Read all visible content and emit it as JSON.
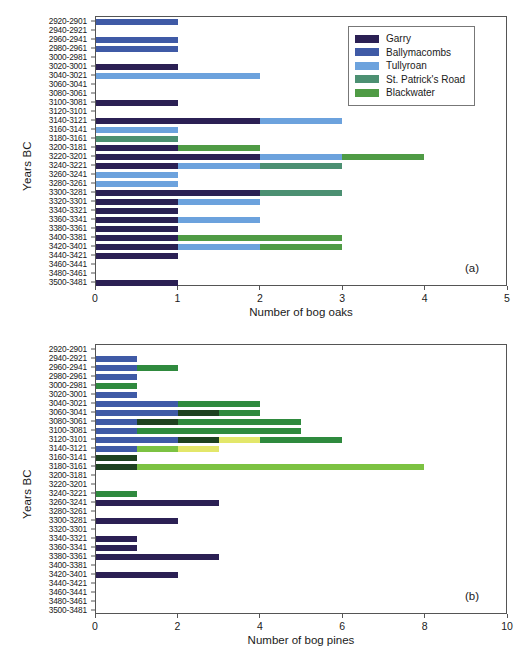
{
  "figure": {
    "panel_a_tag": "(a)",
    "panel_b_tag": "(b)"
  },
  "chart_data": [
    {
      "type": "bar",
      "orientation": "horizontal",
      "stacked": true,
      "panel": "(a)",
      "title": "",
      "xlabel": "Number of bog oaks",
      "ylabel": "Years BC",
      "xlim": [
        0,
        5
      ],
      "xticks": [
        0,
        1,
        2,
        3,
        4,
        5
      ],
      "grid": false,
      "legend_position": "top-right",
      "legend": [
        "Garry",
        "Ballymacombs",
        "Tullyroan",
        "St. Patrick's Road",
        "Blackwater"
      ],
      "colors": {
        "Garry": "#2b2054",
        "Ballymacombs": "#3f5aa6",
        "Tullyroan": "#6ca2dd",
        "St. Patrick's Road": "#4c9072",
        "Blackwater": "#4f9b45"
      },
      "categories": [
        "2920-2901",
        "2940-2921",
        "2960-2941",
        "2980-2961",
        "3000-2981",
        "3020-3001",
        "3040-3021",
        "3060-3041",
        "3080-3061",
        "3100-3081",
        "3120-3101",
        "3140-3121",
        "3160-3141",
        "3180-3161",
        "3200-3181",
        "3220-3201",
        "3240-3221",
        "3260-3241",
        "3280-3261",
        "3300-3281",
        "3320-3301",
        "3340-3321",
        "3360-3341",
        "3380-3361",
        "3400-3381",
        "3420-3401",
        "3440-3421",
        "3460-3441",
        "3480-3461",
        "3500-3481"
      ],
      "series": [
        {
          "name": "Garry",
          "values": [
            0,
            0,
            0,
            0,
            0,
            1,
            0,
            0,
            0,
            1,
            0,
            2,
            0,
            0,
            1,
            2,
            1,
            0,
            0,
            2,
            1,
            1,
            1,
            1,
            1,
            1,
            1,
            0,
            0,
            1
          ]
        },
        {
          "name": "Ballymacombs",
          "values": [
            1,
            0,
            1,
            1,
            0,
            0,
            0,
            0,
            0,
            0,
            0,
            0,
            0,
            0,
            0,
            0,
            0,
            0,
            0,
            0,
            0,
            0,
            0,
            0,
            0,
            0,
            0,
            0,
            0,
            0
          ]
        },
        {
          "name": "Tullyroan",
          "values": [
            0,
            0,
            0,
            0,
            0,
            0,
            2,
            0,
            0,
            0,
            0,
            1,
            1,
            0,
            0,
            1,
            1,
            1,
            1,
            0,
            1,
            0,
            1,
            0,
            0,
            1,
            0,
            0,
            0,
            0
          ]
        },
        {
          "name": "St. Patrick's Road",
          "values": [
            0,
            0,
            0,
            0,
            0,
            0,
            0,
            0,
            0,
            0,
            0,
            0,
            0,
            1,
            0,
            0,
            1,
            0,
            0,
            1,
            0,
            0,
            0,
            0,
            0,
            0,
            0,
            0,
            0,
            0
          ]
        },
        {
          "name": "Blackwater",
          "values": [
            0,
            0,
            0,
            0,
            0,
            0,
            0,
            0,
            0,
            0,
            0,
            0,
            0,
            0,
            1,
            1,
            0,
            0,
            0,
            0,
            0,
            0,
            0,
            0,
            2,
            1,
            0,
            0,
            0,
            0
          ]
        }
      ],
      "totals": [
        1,
        0,
        1,
        1,
        0,
        1,
        2,
        0,
        0,
        1,
        0,
        3,
        1,
        1,
        2,
        4,
        3,
        1,
        1,
        3,
        2,
        1,
        2,
        1,
        3,
        3,
        1,
        0,
        0,
        1
      ]
    },
    {
      "type": "bar",
      "orientation": "horizontal",
      "stacked": true,
      "panel": "(b)",
      "title": "",
      "xlabel": "Number of bog pines",
      "ylabel": "Years BC",
      "xlim": [
        0,
        10
      ],
      "xticks": [
        0,
        2,
        4,
        6,
        8,
        10
      ],
      "grid": false,
      "legend_position": "middle-right",
      "legend": [
        "Garry",
        "Ballymacombs",
        "Sharvogues",
        "Tamlaghtmore",
        "Derrycrow",
        "Altnahinch",
        "Eskragh"
      ],
      "colors": {
        "Garry": "#2b2054",
        "Ballymacombs": "#3f5aa6",
        "Sharvogues": "#1e4220",
        "Tamlaghtmore": "#2f7a37",
        "Derrycrow": "#7cc242",
        "Altnahinch": "#e3e76a",
        "Eskragh": "#2f8a3e"
      },
      "categories": [
        "2920-2901",
        "2940-2921",
        "2960-2941",
        "2980-2961",
        "3000-2981",
        "3020-3001",
        "3040-3021",
        "3060-3041",
        "3080-3061",
        "3100-3081",
        "3120-3101",
        "3140-3121",
        "3160-3141",
        "3180-3161",
        "3200-3181",
        "3220-3201",
        "3240-3221",
        "3260-3241",
        "3280-3261",
        "3300-3281",
        "3320-3301",
        "3340-3321",
        "3360-3341",
        "3380-3361",
        "3400-3381",
        "3420-3401",
        "3440-3421",
        "3460-3441",
        "3480-3461",
        "3500-3481"
      ],
      "series": [
        {
          "name": "Garry",
          "values": [
            0,
            0,
            0,
            0,
            0,
            0,
            0,
            0,
            0,
            0,
            0,
            0,
            0,
            0,
            0,
            0,
            0,
            3,
            0,
            2,
            0,
            1,
            1,
            3,
            0,
            2,
            0,
            0,
            0,
            0
          ]
        },
        {
          "name": "Ballymacombs",
          "values": [
            0,
            1,
            1,
            1,
            0,
            1,
            2,
            2,
            1,
            1,
            2,
            1,
            0,
            0,
            0,
            0,
            0,
            0,
            0,
            0,
            0,
            0,
            0,
            0,
            0,
            0,
            0,
            0,
            0,
            0
          ]
        },
        {
          "name": "Sharvogues",
          "values": [
            0,
            0,
            0,
            0,
            0,
            0,
            0,
            1,
            1,
            0,
            1,
            0,
            1,
            1,
            0,
            0,
            0,
            0,
            0,
            0,
            0,
            0,
            0,
            0,
            0,
            0,
            0,
            0,
            0,
            0
          ]
        },
        {
          "name": "Tamlaghtmore",
          "values": [
            0,
            0,
            0,
            0,
            0,
            0,
            0,
            0,
            0,
            0,
            0,
            0,
            0,
            0,
            0,
            0,
            0,
            0,
            0,
            0,
            0,
            0,
            0,
            0,
            0,
            0,
            0,
            0,
            0,
            0
          ]
        },
        {
          "name": "Derrycrow",
          "values": [
            0,
            0,
            0,
            0,
            0,
            0,
            0,
            0,
            0,
            0,
            0,
            1,
            0,
            7,
            0,
            0,
            0,
            0,
            0,
            0,
            0,
            0,
            0,
            0,
            0,
            0,
            0,
            0,
            0,
            0
          ]
        },
        {
          "name": "Altnahinch",
          "values": [
            0,
            0,
            0,
            0,
            0,
            0,
            0,
            0,
            0,
            0,
            1,
            1,
            0,
            0,
            0,
            0,
            0,
            0,
            0,
            0,
            0,
            0,
            0,
            0,
            0,
            0,
            0,
            0,
            0,
            0
          ]
        },
        {
          "name": "Eskragh",
          "values": [
            0,
            0,
            1,
            0,
            1,
            0,
            2,
            1,
            3,
            4,
            2,
            0,
            0,
            0,
            0,
            0,
            1,
            0,
            0,
            0,
            0,
            0,
            0,
            0,
            0,
            0,
            0,
            0,
            0,
            0
          ]
        }
      ],
      "totals": [
        0,
        1,
        2,
        1,
        1,
        1,
        4,
        5,
        5,
        6,
        5,
        3,
        1,
        8,
        0,
        0,
        1,
        3,
        0,
        2,
        0,
        1,
        1,
        3,
        0,
        2,
        0,
        0,
        0,
        0
      ]
    }
  ]
}
